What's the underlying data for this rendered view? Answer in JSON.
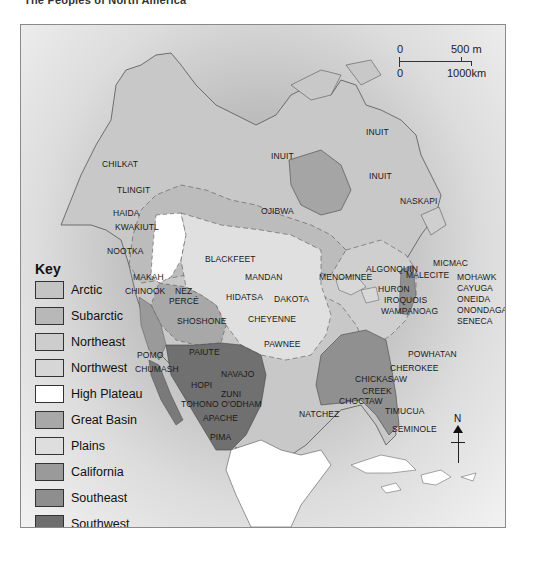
{
  "title": "The Peoples of North America",
  "scale": {
    "top_left": "0",
    "top_right": "500 m",
    "bottom_left": "0",
    "bottom_right": "1000km"
  },
  "compass": {
    "label": "N"
  },
  "key": {
    "title": "Key",
    "items": [
      {
        "label": "Arctic",
        "color": "#c4c4c4"
      },
      {
        "label": "Subarctic",
        "color": "#b8b8b8"
      },
      {
        "label": "Northeast",
        "color": "#cdcdcd"
      },
      {
        "label": "Northwest",
        "color": "#d6d6d6"
      },
      {
        "label": "High Plateau",
        "color": "#ffffff"
      },
      {
        "label": "Great Basin",
        "color": "#a8a8a8"
      },
      {
        "label": "Plains",
        "color": "#dedede"
      },
      {
        "label": "California",
        "color": "#9a9a9a"
      },
      {
        "label": "Southeast",
        "color": "#8e8e8e"
      },
      {
        "label": "Southwest",
        "color": "#6e6e6e"
      }
    ]
  },
  "tribes": {
    "chilkat": "CHILKAT",
    "tlingit": "TLINGIT",
    "haida": "HAIDA",
    "kwakiutl": "KWAKIUTL",
    "nootka": "NOOTKA",
    "makah": "MAKAH",
    "chinook": "CHINOOK",
    "inuit_1": "INUIT",
    "inuit_2": "INUIT",
    "inuit_3": "INUIT",
    "ojibwa": "OJIBWA",
    "naskapi": "NASKAPI",
    "algonquin": "ALGONQUIN",
    "blackfeet": "BLACKFEET",
    "nez_perce_1": "NEZ",
    "nez_perce_2": "PERCÉ",
    "mandan": "MANDAN",
    "hidatsa": "HIDATSA",
    "dakota": "DAKOTA",
    "menominee": "MENOMINEE",
    "micmac": "MICMAC",
    "malecite": "MALECITE",
    "huron": "HURON",
    "iroquois": "IROQUOIS",
    "wampanoag": "WAMPANOAG",
    "mohawk": "MOHAWK",
    "cayuga": "CAYUGA",
    "oneida": "ONEIDA",
    "onondaga": "ONONDAGA",
    "seneca": "SENECA",
    "shoshone": "SHOSHONE",
    "cheyenne": "CHEYENNE",
    "pawnee": "PAWNEE",
    "pomo": "POMO",
    "chumash": "CHUMASH",
    "paiute": "PAIUTE",
    "powhatan": "POWHATAN",
    "cherokee": "CHEROKEE",
    "chickasaw": "CHICKASAW",
    "creek": "CREEK",
    "choctaw": "CHOCTAW",
    "natchez": "NATCHEZ",
    "timucua": "TIMUCUA",
    "seminole": "SEMINOLE",
    "hopi": "HOPI",
    "navajo": "NAVAJO",
    "zuni": "ZUNI",
    "tohono_oodham": "TOHONO O'ODHAM",
    "apache": "APACHE",
    "pima": "PIMA"
  }
}
